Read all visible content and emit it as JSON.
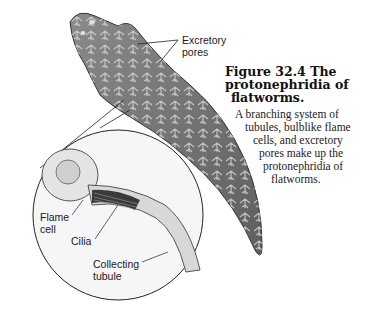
{
  "figure": {
    "title_lines": [
      "Figure 32.4   The",
      "protonephridia of",
      "flatworms."
    ],
    "body_lines": [
      "A branching system of",
      "tubules, bulblike flame",
      "cells, and excretory",
      "pores make up the",
      "protonephridia of",
      "flatworms."
    ]
  },
  "labels": {
    "excretory_pores": [
      "Excretory",
      "pores"
    ],
    "flame_cell": [
      "Flame",
      "cell"
    ],
    "cilia": [
      "Cilia"
    ],
    "collecting_tubule": [
      "Collecting",
      "tubule"
    ]
  },
  "colors": {
    "worm_fill": "#6e6e6e",
    "worm_tubules": "#c8c8c8",
    "inset_bg": "#f4f4f4",
    "outline": "#222222"
  }
}
